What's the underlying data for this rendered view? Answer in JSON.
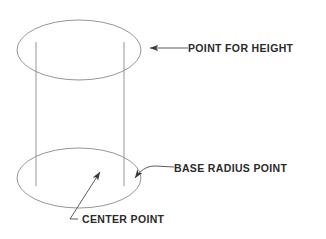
{
  "diagram": {
    "type": "technical-line-drawing",
    "object": "cylinder",
    "colors": {
      "background": "#ffffff",
      "outline": "#8a8a8a",
      "leader": "#4a4a4a",
      "text": "#2b2b2b"
    },
    "geometry": {
      "top_ellipse": {
        "cx": 79,
        "cy": 50,
        "rx": 62,
        "ry": 30
      },
      "bottom_ellipse": {
        "cx": 79,
        "cy": 178,
        "rx": 62,
        "ry": 30
      },
      "left_side_line": {
        "x": 36,
        "y1": 50,
        "y2": 178
      },
      "right_side_line": {
        "x": 124,
        "y1": 50,
        "y2": 178
      }
    },
    "callouts": [
      {
        "id": "point-for-height",
        "label": "POINT FOR HEIGHT",
        "text_x": 188,
        "text_y": 52,
        "leader": "M188,48 L150,48",
        "arrow_tip": {
          "x": 142,
          "y": 48
        },
        "arrow_angle": 180
      },
      {
        "id": "base-radius-point",
        "label": "BASE RADIUS POINT",
        "text_x": 174,
        "text_y": 172,
        "leader": "M174,167 L155,166 C146,166 140,171 135,178",
        "arrow_tip": {
          "x": 131,
          "y": 183
        },
        "arrow_angle": 128
      },
      {
        "id": "center-point",
        "label": "CENTER POINT",
        "text_x": 82,
        "text_y": 223,
        "leader": "M78,219 L70,219 L100,172",
        "arrow_tip": {
          "x": 103,
          "y": 167
        },
        "arrow_angle": -57
      }
    ]
  }
}
